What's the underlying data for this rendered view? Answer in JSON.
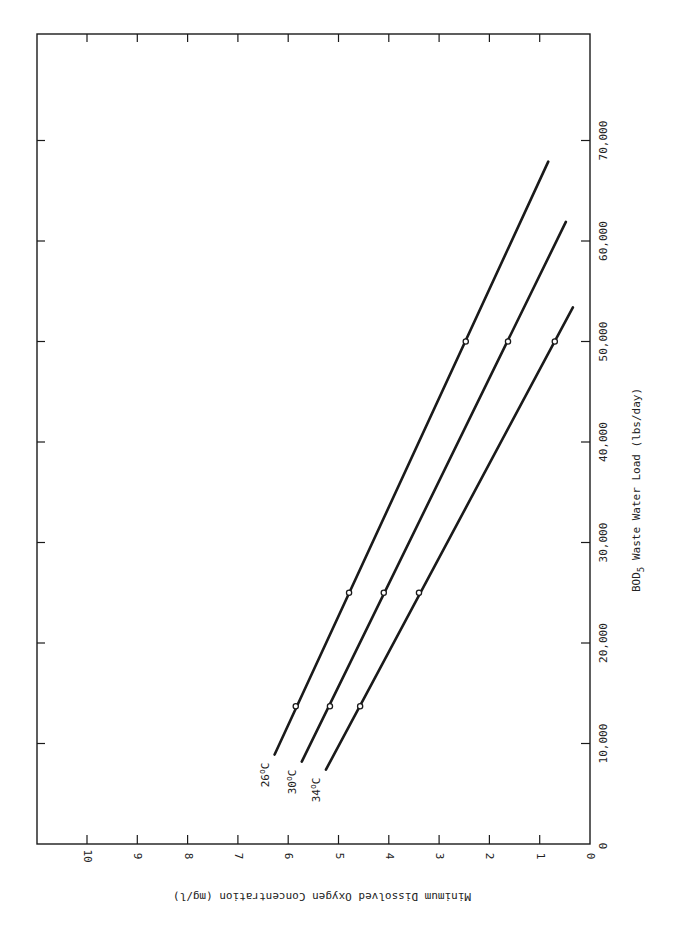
{
  "chart_data": {
    "type": "line",
    "orientation_note": "figure printed rotated 90° clockwise: DO axis runs along bottom (10 left → 0 right), BOD axis along right edge (0 bottom → 70,000 top)",
    "title": "",
    "xlabel": "BOD5 Waste Water Load (lbs/day)",
    "ylabel": "Minimum Dissolved Oxygen Concentration (mg/l)",
    "xlabel_main": "BOD",
    "xlabel_sub": "5",
    "xlabel_rest": " Waste Water Load (lbs/day)",
    "xlim": [
      0,
      78000
    ],
    "ylim": [
      0,
      10
    ],
    "x_ticks": [
      10000,
      20000,
      30000,
      40000,
      50000,
      60000,
      70000
    ],
    "x_tick_labels": [
      "10,000",
      "20,000",
      "30,000",
      "40,000",
      "50,000",
      "60,000",
      "70,000"
    ],
    "x_zero_label": "0",
    "y_ticks": [
      0,
      1,
      2,
      3,
      4,
      5,
      6,
      7,
      8,
      9,
      10
    ],
    "y_tick_labels": [
      "0",
      "1",
      "2",
      "3",
      "4",
      "5",
      "6",
      "7",
      "8",
      "9",
      "10"
    ],
    "grid": false,
    "legend": "inline labels at line starts",
    "series": [
      {
        "name": "26°C",
        "label_main": "26",
        "label_deg": "o",
        "label_unit": "C",
        "line_start": [
          8900,
          6.27
        ],
        "line_end": [
          67900,
          0.83
        ],
        "points": [
          [
            13700,
            5.85
          ],
          [
            25000,
            4.79
          ],
          [
            50000,
            2.47
          ]
        ]
      },
      {
        "name": "30°C",
        "label_main": "30",
        "label_deg": "o",
        "label_unit": "C",
        "line_start": [
          8200,
          5.73
        ],
        "line_end": [
          61900,
          0.48
        ],
        "points": [
          [
            13700,
            5.17
          ],
          [
            25000,
            4.1
          ],
          [
            50000,
            1.63
          ]
        ]
      },
      {
        "name": "34°C",
        "label_main": "34",
        "label_deg": "o",
        "label_unit": "C",
        "line_start": [
          7400,
          5.25
        ],
        "line_end": [
          53400,
          0.34
        ],
        "points": [
          [
            13700,
            4.57
          ],
          [
            25000,
            3.4
          ],
          [
            50000,
            0.7
          ]
        ]
      }
    ]
  },
  "colors": {
    "ink": "#1a1a1a",
    "paper": "#ffffff"
  }
}
